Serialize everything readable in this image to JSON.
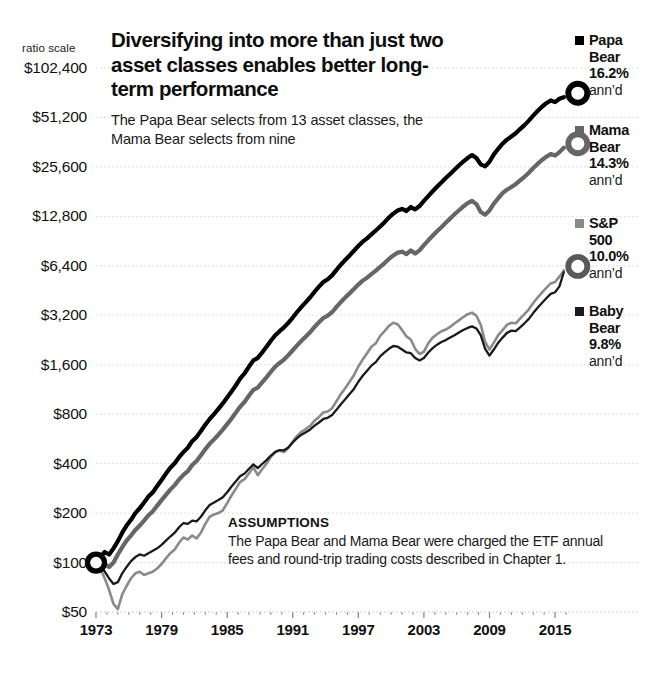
{
  "chart_data": {
    "type": "line",
    "title": "Diversifying into more than just two asset classes enables better long-term performance",
    "subtitle": "The Papa Bear selects from 13 asset classes, the Mama Bear selects from nine",
    "scale_note": "ratio scale",
    "xlabel": "",
    "ylabel": "",
    "grid": true,
    "legend_position": "right",
    "y_scale": "log",
    "ylim": [
      50,
      102400
    ],
    "xlim": [
      1973,
      2016
    ],
    "y_ticks": [
      "$102,400",
      "$51,200",
      "$25,600",
      "$12,800",
      "$6,400",
      "$3,200",
      "$1,600",
      "$800",
      "$400",
      "$200",
      "$100",
      "$50"
    ],
    "y_tick_values": [
      102400,
      51200,
      25600,
      12800,
      6400,
      3200,
      1600,
      800,
      400,
      200,
      100,
      50
    ],
    "x_ticks": [
      "1973",
      "1979",
      "1985",
      "1991",
      "1997",
      "2003",
      "2009",
      "2015"
    ],
    "x_tick_values": [
      1973,
      1979,
      1985,
      1991,
      1997,
      2003,
      2009,
      2015
    ],
    "start_marker": {
      "x": 1973,
      "y": 100,
      "label": "$100"
    },
    "series": [
      {
        "name": "Papa Bear",
        "short": "Papa Bear",
        "annualized": "16.2%",
        "annualized_value": 16.2,
        "color": "#000000",
        "width": 4.2,
        "end_value": 68000,
        "x": [
          1973.0,
          1973.4,
          1973.8,
          1974.2,
          1974.6,
          1975.0,
          1975.4,
          1975.8,
          1976.2,
          1976.6,
          1977.0,
          1977.4,
          1977.8,
          1978.2,
          1978.6,
          1979.0,
          1979.4,
          1979.8,
          1980.2,
          1980.6,
          1981.0,
          1981.4,
          1981.8,
          1982.2,
          1982.6,
          1983.0,
          1983.4,
          1983.8,
          1984.2,
          1984.6,
          1985.0,
          1985.4,
          1985.8,
          1986.2,
          1986.6,
          1987.0,
          1987.4,
          1987.8,
          1988.2,
          1988.6,
          1989.0,
          1989.4,
          1989.8,
          1990.2,
          1990.6,
          1991.0,
          1991.4,
          1991.8,
          1992.2,
          1992.6,
          1993.0,
          1993.4,
          1993.8,
          1994.2,
          1994.6,
          1995.0,
          1995.4,
          1995.8,
          1996.2,
          1996.6,
          1997.0,
          1997.4,
          1997.8,
          1998.2,
          1998.6,
          1999.0,
          1999.4,
          1999.8,
          2000.2,
          2000.6,
          2001.0,
          2001.4,
          2001.8,
          2002.2,
          2002.6,
          2003.0,
          2003.4,
          2003.8,
          2004.2,
          2004.6,
          2005.0,
          2005.4,
          2005.8,
          2006.2,
          2006.6,
          2007.0,
          2007.4,
          2007.8,
          2008.2,
          2008.6,
          2009.0,
          2009.4,
          2009.8,
          2010.2,
          2010.6,
          2011.0,
          2011.4,
          2011.8,
          2012.2,
          2012.6,
          2013.0,
          2013.4,
          2013.8,
          2014.2,
          2014.6,
          2015.0,
          2015.4,
          2015.8
        ],
        "y": [
          100,
          108,
          116,
          112,
          122,
          135,
          152,
          168,
          182,
          200,
          214,
          232,
          252,
          268,
          292,
          318,
          348,
          378,
          402,
          438,
          470,
          500,
          548,
          580,
          632,
          690,
          748,
          800,
          862,
          930,
          1010,
          1100,
          1200,
          1320,
          1420,
          1560,
          1700,
          1760,
          1900,
          2060,
          2240,
          2420,
          2560,
          2700,
          2880,
          3100,
          3350,
          3600,
          3850,
          4120,
          4450,
          4780,
          5100,
          5300,
          5600,
          6050,
          6500,
          6950,
          7400,
          7900,
          8450,
          8980,
          9400,
          9950,
          10500,
          11100,
          11800,
          12600,
          13300,
          13900,
          14200,
          13800,
          14600,
          14100,
          14800,
          15900,
          17000,
          18200,
          19400,
          20600,
          21900,
          23200,
          24600,
          26100,
          27600,
          29000,
          30200,
          29000,
          26500,
          25800,
          27500,
          30500,
          33000,
          35500,
          37500,
          39200,
          41000,
          43500,
          46000,
          49000,
          52500,
          56000,
          59500,
          62500,
          65000,
          63500,
          66500,
          68000
        ]
      },
      {
        "name": "Mama Bear",
        "short": "Mama Bear",
        "annualized": "14.3%",
        "annualized_value": 14.3,
        "color": "#666666",
        "width": 4.2,
        "end_value": 33500,
        "x": [
          1973.0,
          1973.4,
          1973.8,
          1974.2,
          1974.6,
          1975.0,
          1975.4,
          1975.8,
          1976.2,
          1976.6,
          1977.0,
          1977.4,
          1977.8,
          1978.2,
          1978.6,
          1979.0,
          1979.4,
          1979.8,
          1980.2,
          1980.6,
          1981.0,
          1981.4,
          1981.8,
          1982.2,
          1982.6,
          1983.0,
          1983.4,
          1983.8,
          1984.2,
          1984.6,
          1985.0,
          1985.4,
          1985.8,
          1986.2,
          1986.6,
          1987.0,
          1987.4,
          1987.8,
          1988.2,
          1988.6,
          1989.0,
          1989.4,
          1989.8,
          1990.2,
          1990.6,
          1991.0,
          1991.4,
          1991.8,
          1992.2,
          1992.6,
          1993.0,
          1993.4,
          1993.8,
          1994.2,
          1994.6,
          1995.0,
          1995.4,
          1995.8,
          1996.2,
          1996.6,
          1997.0,
          1997.4,
          1997.8,
          1998.2,
          1998.6,
          1999.0,
          1999.4,
          1999.8,
          2000.2,
          2000.6,
          2001.0,
          2001.4,
          2001.8,
          2002.2,
          2002.6,
          2003.0,
          2003.4,
          2003.8,
          2004.2,
          2004.6,
          2005.0,
          2005.4,
          2005.8,
          2006.2,
          2006.6,
          2007.0,
          2007.4,
          2007.8,
          2008.2,
          2008.6,
          2009.0,
          2009.4,
          2009.8,
          2010.2,
          2010.6,
          2011.0,
          2011.4,
          2011.8,
          2012.2,
          2012.6,
          2013.0,
          2013.4,
          2013.8,
          2014.2,
          2014.6,
          2015.0,
          2015.4,
          2015.8
        ],
        "y": [
          100,
          99,
          98,
          94,
          100,
          112,
          124,
          136,
          146,
          158,
          168,
          180,
          194,
          205,
          222,
          240,
          258,
          278,
          296,
          320,
          342,
          360,
          392,
          415,
          450,
          490,
          528,
          562,
          600,
          644,
          696,
          752,
          818,
          890,
          952,
          1040,
          1125,
          1160,
          1250,
          1340,
          1450,
          1560,
          1640,
          1720,
          1830,
          1960,
          2100,
          2240,
          2380,
          2530,
          2720,
          2900,
          3080,
          3180,
          3340,
          3600,
          3850,
          4100,
          4350,
          4620,
          4920,
          5200,
          5420,
          5700,
          5980,
          6300,
          6650,
          7050,
          7400,
          7700,
          7800,
          7550,
          7950,
          7600,
          7950,
          8550,
          9150,
          9750,
          10400,
          11000,
          11700,
          12400,
          13200,
          13900,
          14700,
          15400,
          15900,
          15200,
          13600,
          13100,
          13900,
          15300,
          16500,
          17700,
          18600,
          19300,
          20100,
          21200,
          22300,
          23600,
          25200,
          26700,
          28200,
          29500,
          30700,
          30000,
          31500,
          33500
        ]
      },
      {
        "name": "S&P 500",
        "short": "S&P 500",
        "annualized": "10.0%",
        "annualized_value": 10.0,
        "color": "#8a8a8a",
        "width": 2.6,
        "end_value": 6000,
        "x": [
          1973.0,
          1973.4,
          1973.8,
          1974.2,
          1974.6,
          1975.0,
          1975.4,
          1975.8,
          1976.2,
          1976.6,
          1977.0,
          1977.4,
          1977.8,
          1978.2,
          1978.6,
          1979.0,
          1979.4,
          1979.8,
          1980.2,
          1980.6,
          1981.0,
          1981.4,
          1981.8,
          1982.2,
          1982.6,
          1983.0,
          1983.4,
          1983.8,
          1984.2,
          1984.6,
          1985.0,
          1985.4,
          1985.8,
          1986.2,
          1986.6,
          1987.0,
          1987.4,
          1987.8,
          1988.2,
          1988.6,
          1989.0,
          1989.4,
          1989.8,
          1990.2,
          1990.6,
          1991.0,
          1991.4,
          1991.8,
          1992.2,
          1992.6,
          1993.0,
          1993.4,
          1993.8,
          1994.2,
          1994.6,
          1995.0,
          1995.4,
          1995.8,
          1996.2,
          1996.6,
          1997.0,
          1997.4,
          1997.8,
          1998.2,
          1998.6,
          1999.0,
          1999.4,
          1999.8,
          2000.2,
          2000.6,
          2001.0,
          2001.4,
          2001.8,
          2002.2,
          2002.6,
          2003.0,
          2003.4,
          2003.8,
          2004.2,
          2004.6,
          2005.0,
          2005.4,
          2005.8,
          2006.2,
          2006.6,
          2007.0,
          2007.4,
          2007.8,
          2008.2,
          2008.6,
          2009.0,
          2009.4,
          2009.8,
          2010.2,
          2010.6,
          2011.0,
          2011.4,
          2011.8,
          2012.2,
          2012.6,
          2013.0,
          2013.4,
          2013.8,
          2014.2,
          2014.6,
          2015.0,
          2015.4,
          2015.8
        ],
        "y": [
          100,
          92,
          80,
          68,
          56,
          52,
          64,
          72,
          80,
          86,
          88,
          84,
          86,
          88,
          92,
          98,
          106,
          114,
          120,
          132,
          142,
          138,
          146,
          140,
          152,
          172,
          190,
          196,
          200,
          208,
          230,
          256,
          282,
          310,
          322,
          350,
          380,
          340,
          370,
          400,
          440,
          470,
          480,
          470,
          500,
          545,
          590,
          625,
          650,
          680,
          730,
          770,
          820,
          830,
          870,
          960,
          1060,
          1150,
          1260,
          1380,
          1560,
          1720,
          1880,
          2060,
          2160,
          2400,
          2560,
          2760,
          2880,
          2820,
          2600,
          2380,
          2280,
          2000,
          1860,
          1920,
          2160,
          2340,
          2450,
          2560,
          2620,
          2720,
          2850,
          2980,
          3120,
          3250,
          3320,
          3180,
          2800,
          2200,
          1980,
          2180,
          2420,
          2600,
          2800,
          2880,
          2860,
          3050,
          3250,
          3480,
          3800,
          4100,
          4400,
          4700,
          5000,
          5100,
          5500,
          6000
        ]
      },
      {
        "name": "Baby Bear",
        "short": "Baby Bear",
        "annualized": "9.8%",
        "annualized_value": 9.8,
        "color": "#1a1a1a",
        "width": 2.3,
        "end_value": 5850,
        "x": [
          1973.0,
          1973.4,
          1973.8,
          1974.2,
          1974.6,
          1975.0,
          1975.4,
          1975.8,
          1976.2,
          1976.6,
          1977.0,
          1977.4,
          1977.8,
          1978.2,
          1978.6,
          1979.0,
          1979.4,
          1979.8,
          1980.2,
          1980.6,
          1981.0,
          1981.4,
          1981.8,
          1982.2,
          1982.6,
          1983.0,
          1983.4,
          1983.8,
          1984.2,
          1984.6,
          1985.0,
          1985.4,
          1985.8,
          1986.2,
          1986.6,
          1987.0,
          1987.4,
          1987.8,
          1988.2,
          1988.6,
          1989.0,
          1989.4,
          1989.8,
          1990.2,
          1990.6,
          1991.0,
          1991.4,
          1991.8,
          1992.2,
          1992.6,
          1993.0,
          1993.4,
          1993.8,
          1994.2,
          1994.6,
          1995.0,
          1995.4,
          1995.8,
          1996.2,
          1996.6,
          1997.0,
          1997.4,
          1997.8,
          1998.2,
          1998.6,
          1999.0,
          1999.4,
          1999.8,
          2000.2,
          2000.6,
          2001.0,
          2001.4,
          2001.8,
          2002.2,
          2002.6,
          2003.0,
          2003.4,
          2003.8,
          2004.2,
          2004.6,
          2005.0,
          2005.4,
          2005.8,
          2006.2,
          2006.6,
          2007.0,
          2007.4,
          2007.8,
          2008.2,
          2008.6,
          2009.0,
          2009.4,
          2009.8,
          2010.2,
          2010.6,
          2011.0,
          2011.4,
          2011.8,
          2012.2,
          2012.6,
          2013.0,
          2013.4,
          2013.8,
          2014.2,
          2014.6,
          2015.0,
          2015.4,
          2015.8
        ],
        "y": [
          100,
          96,
          88,
          80,
          74,
          76,
          86,
          94,
          102,
          108,
          112,
          110,
          114,
          118,
          122,
          128,
          136,
          144,
          152,
          164,
          174,
          172,
          180,
          178,
          190,
          208,
          224,
          232,
          240,
          250,
          268,
          290,
          312,
          336,
          348,
          372,
          396,
          376,
          398,
          420,
          448,
          472,
          484,
          482,
          502,
          538,
          572,
          600,
          622,
          646,
          682,
          712,
          748,
          760,
          790,
          850,
          920,
          985,
          1060,
          1140,
          1260,
          1370,
          1470,
          1580,
          1660,
          1800,
          1900,
          2000,
          2080,
          2060,
          1980,
          1900,
          1880,
          1760,
          1700,
          1760,
          1900,
          2020,
          2120,
          2200,
          2260,
          2340,
          2420,
          2510,
          2600,
          2680,
          2740,
          2660,
          2420,
          2000,
          1820,
          1980,
          2180,
          2340,
          2500,
          2580,
          2560,
          2700,
          2860,
          3040,
          3300,
          3560,
          3800,
          4060,
          4320,
          4420,
          4800,
          5850
        ]
      }
    ]
  },
  "assumptions": {
    "heading": "ASSUMPTIONS",
    "line1": "The Papa Bear and Mama Bear were charged the ETF annual",
    "line2": "fees and round-trip trading costs described in Chapter 1."
  },
  "legend": {
    "items": [
      {
        "name_line1": "Papa",
        "name_line2": "Bear",
        "pct": "16.2%",
        "annd": "ann’d",
        "color": "#000000"
      },
      {
        "name_line1": "Mama",
        "name_line2": "Bear",
        "pct": "14.3%",
        "annd": "ann’d",
        "color": "#666666"
      },
      {
        "name_line1": "S&P",
        "name_line2": "500",
        "pct": "10.0%",
        "annd": "ann’d",
        "color": "#8a8a8a"
      },
      {
        "name_line1": "Baby",
        "name_line2": "Bear",
        "pct": "9.8%",
        "annd": "ann’d",
        "color": "#1a1a1a"
      }
    ]
  },
  "colors": {
    "papa": "#000000",
    "mama": "#666666",
    "sp500": "#8a8a8a",
    "baby": "#1a1a1a",
    "grid": "#d8d8d8",
    "text": "#111111",
    "background": "#ffffff"
  }
}
